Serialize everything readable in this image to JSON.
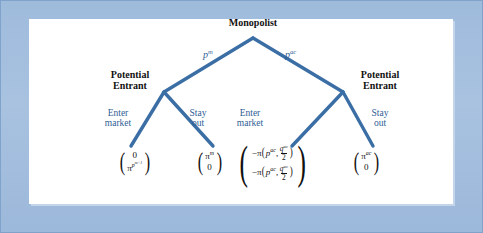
{
  "figure": {
    "type": "extensive-form-game-tree",
    "frame_color": "#a3bfdd",
    "panel_color": "#ffffff",
    "branch_color": "#3a6ea5",
    "node_text_color": "#111111",
    "label_text_color": "#2f5e96"
  },
  "root": {
    "label": "Monopolist"
  },
  "branches": [
    {
      "id": "left-branch",
      "label_prefix": "p",
      "label_sup": "m"
    },
    {
      "id": "right-branch",
      "label_prefix": "p",
      "label_sup": "ac"
    }
  ],
  "decision_nodes": [
    {
      "id": "left-entrant",
      "line1": "Potential",
      "line2": "Entrant"
    },
    {
      "id": "right-entrant",
      "line1": "Potential",
      "line2": "Entrant"
    }
  ],
  "actions": [
    {
      "id": "enter-left",
      "line1": "Enter",
      "line2": "market"
    },
    {
      "id": "stay-left",
      "line1": "Stay",
      "line2": "out"
    },
    {
      "id": "enter-right",
      "line1": "Enter",
      "line2": "market"
    },
    {
      "id": "stay-right",
      "line1": "Stay",
      "line2": "out"
    }
  ],
  "payoffs": [
    {
      "id": "payoff-enter-left",
      "top": {
        "text": "0"
      },
      "bottom": {
        "base": "π",
        "sup_base": "p",
        "sup_sup": "m+1"
      }
    },
    {
      "id": "payoff-stay-left",
      "top": {
        "base": "π",
        "sup": "m"
      },
      "bottom": {
        "text": "0"
      }
    },
    {
      "id": "payoff-enter-right",
      "top": {
        "sign": "−",
        "fn": "π",
        "arg1_base": "p",
        "arg1_sup": "ac",
        "sep": ",",
        "num_base": "q",
        "num_sup": "ac",
        "den": "2"
      },
      "bottom": {
        "sign": "−",
        "fn": "π",
        "arg1_base": "p",
        "arg1_sup": "ac",
        "sep": ",",
        "num_base": "q",
        "num_sup": "ac",
        "den": "2"
      }
    },
    {
      "id": "payoff-stay-right",
      "top": {
        "base": "π",
        "sup": "ac"
      },
      "bottom": {
        "text": "0"
      }
    }
  ]
}
